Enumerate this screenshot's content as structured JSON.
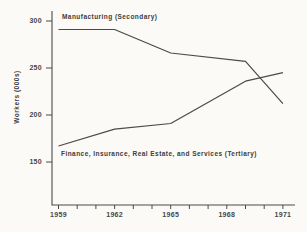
{
  "figure": {
    "background": "#fbfaf7",
    "ink_color": "#4a4a4a",
    "text_color": "#3c3c3c"
  },
  "chart_data": {
    "type": "line",
    "title": "",
    "xlabel": "",
    "ylabel": "Workers (000s)",
    "grid": false,
    "legend_position": "inline-annotations",
    "x_range": [
      1959,
      1971
    ],
    "ylim": [
      100,
      310
    ],
    "x_tick_labels": [
      "1959",
      "1962",
      "1965",
      "1968",
      "1971"
    ],
    "x_ticks_labeled_years": [
      1959,
      1962,
      1965,
      1968,
      1971
    ],
    "x_minor_tick_years": [
      1959,
      1960,
      1961,
      1962,
      1963,
      1964,
      1965,
      1966,
      1967,
      1968,
      1969,
      1970,
      1971
    ],
    "y_tick_labels": [
      "300",
      "250",
      "200",
      "150"
    ],
    "y_ticks": [
      300,
      250,
      200,
      150
    ],
    "series": [
      {
        "name": "Manufacturing (Secondary)",
        "x": [
          1959,
          1962,
          1965,
          1969,
          1971
        ],
        "values": [
          291,
          291,
          266,
          257,
          212
        ]
      },
      {
        "name": "Finance, Insurance, Real Estate, and Services (Tertiary)",
        "x": [
          1959,
          1962,
          1965,
          1969,
          1971
        ],
        "values": [
          167,
          185,
          191,
          236,
          245
        ]
      }
    ]
  }
}
